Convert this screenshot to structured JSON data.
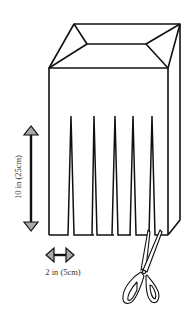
{
  "diagram": {
    "labels": {
      "height": "10 in (25cm)",
      "width": "2 in (5cm)"
    },
    "slit_count": 5,
    "colors": {
      "line": "#111111",
      "arrow_fill": "#a8a8a8",
      "background": "#ffffff"
    },
    "icons": {
      "scissors": "scissors-icon",
      "vertical_arrow": "double-arrow-vertical-icon",
      "horizontal_arrow": "double-arrow-horizontal-icon"
    }
  }
}
